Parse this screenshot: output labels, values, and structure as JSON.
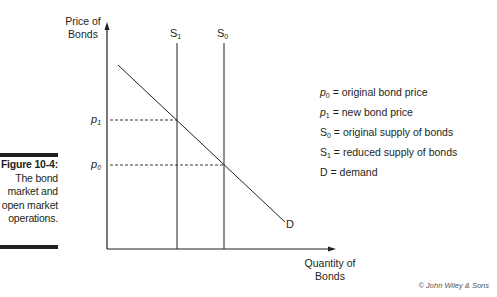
{
  "figure": {
    "number_label": "Figure 10-4:",
    "caption_lines": [
      "The bond",
      "market and",
      "open market",
      "operations."
    ],
    "credit": "© John Wiley & Sons"
  },
  "axes": {
    "y_label_line1": "Price of",
    "y_label_line2": "Bonds",
    "x_label_line1": "Quantity of",
    "x_label_line2": "Bonds"
  },
  "curves": {
    "s1": {
      "label": "S",
      "sub": "1"
    },
    "s0": {
      "label": "S",
      "sub": "0"
    },
    "d": {
      "label": "D"
    }
  },
  "price_ticks": {
    "p1": {
      "label": "p",
      "sub": "1"
    },
    "p0": {
      "label": "p",
      "sub": "0"
    }
  },
  "legend": [
    {
      "sym": "p",
      "sub": "0",
      "text": " = original bond price",
      "italic": true
    },
    {
      "sym": "p",
      "sub": "1",
      "text": " = new bond price",
      "italic": true
    },
    {
      "sym": "S",
      "sub": "0",
      "text": " = original supply of bonds",
      "italic": false
    },
    {
      "sym": "S",
      "sub": "1",
      "text": " = reduced supply of bonds",
      "italic": false
    },
    {
      "sym": "D",
      "sub": "",
      "text": " = demand",
      "italic": false
    }
  ],
  "colors": {
    "ink": "#231f20",
    "credit": "#555555"
  }
}
